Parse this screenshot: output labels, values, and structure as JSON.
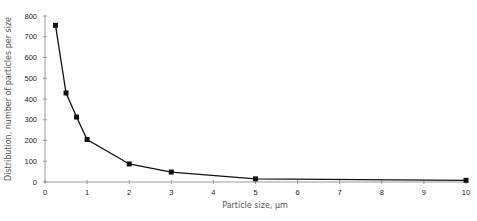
{
  "chart_data": {
    "type": "line",
    "title": "",
    "xlabel": "Particle size, µm",
    "ylabel": "Distribution, number of particles per size",
    "x": [
      0.25,
      0.5,
      0.75,
      1,
      2,
      3,
      5,
      10
    ],
    "series": [
      {
        "name": "Distribution",
        "values": [
          755,
          429,
          313,
          205,
          87,
          48,
          15,
          8
        ],
        "marker": "square",
        "color": "#111111"
      }
    ],
    "xlim": [
      0,
      10
    ],
    "ylim": [
      0,
      800
    ],
    "xticks": [
      0,
      1,
      2,
      3,
      4,
      5,
      6,
      7,
      8,
      9,
      10
    ],
    "yticks": [
      0,
      100,
      200,
      300,
      400,
      500,
      600,
      700,
      800
    ],
    "grid": false,
    "legend": "none"
  },
  "labels": {
    "xlabel": "Particle size, µm",
    "ylabel": "Distribution, number of particles per size"
  }
}
